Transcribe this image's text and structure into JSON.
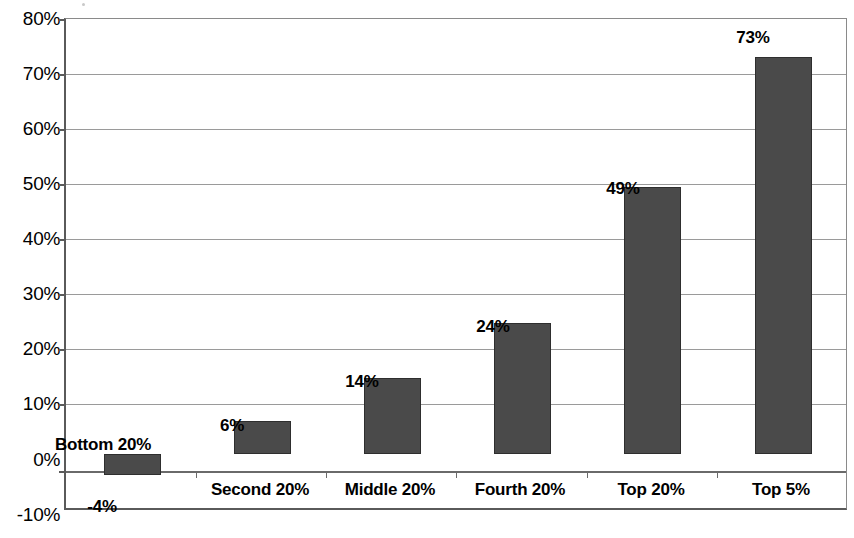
{
  "chart_data": {
    "type": "bar",
    "title": "",
    "subtitle": "",
    "xlabel": "",
    "ylabel": "",
    "categories": [
      "Bottom 20%",
      "Second 20%",
      "Middle 20%",
      "Fourth 20%",
      "Top 20%",
      "Top 5%"
    ],
    "values": [
      -4,
      6,
      14,
      24,
      49,
      73
    ],
    "value_labels": [
      "-4%",
      "6%",
      "14%",
      "24%",
      "49%",
      "73%"
    ],
    "series": [
      {
        "name": "",
        "values": [
          -4,
          6,
          14,
          24,
          49,
          73
        ]
      }
    ],
    "ylim": [
      -10,
      80
    ],
    "ytick_values": [
      80,
      70,
      60,
      50,
      40,
      30,
      20,
      10,
      0,
      -10
    ],
    "ytick_labels": [
      "80%",
      "70%",
      "60%",
      "50%",
      "40%",
      "30%",
      "20%",
      "10%",
      "0%",
      "-10%"
    ],
    "grid": true,
    "grid_axis": "y",
    "legend": false,
    "legend_position": "none",
    "bar_color": "#4a4a4a",
    "bar_border_color": "#2e2e2e",
    "gridline_color": "#9a9a9a",
    "axis_color": "#5a5a5a",
    "background_color": "#ffffff",
    "annotations": []
  }
}
